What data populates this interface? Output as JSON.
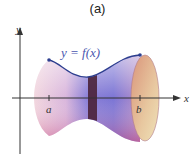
{
  "figure": {
    "caption": "(a)",
    "curve_label": "y = f(x)",
    "axes": {
      "x_label": "x",
      "y_label": "y"
    },
    "ticks": {
      "left": "a",
      "right": "b"
    }
  }
}
